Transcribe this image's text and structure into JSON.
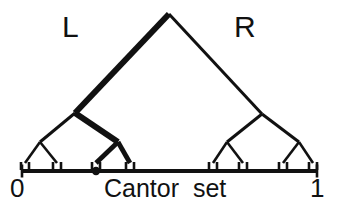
{
  "figure": {
    "kind": "cantor-set-binary-tree-diagram",
    "caption": "Cantor  set",
    "branch_labels": {
      "left": "L",
      "right": "R"
    },
    "axis": {
      "start_label": "0",
      "end_label": "1",
      "x_start": 22,
      "x_end": 317,
      "y": 171,
      "cap_height": 13,
      "line_width": 4
    },
    "marked_point": {
      "label": "",
      "x": 96,
      "y": 171,
      "radius": 4.2
    },
    "colors": {
      "ink": "#111111",
      "background": "#ffffff"
    },
    "stroke_widths": {
      "thin": 3.0,
      "bold": 6.0,
      "leaf": 2.6,
      "tick": 2.6
    },
    "tree": {
      "apex": {
        "x": 169,
        "y": 14
      },
      "nodes": [
        {
          "id": "root",
          "x": 169,
          "y": 14,
          "depth": 0
        },
        {
          "id": "L",
          "x": 75,
          "y": 113,
          "depth": 1
        },
        {
          "id": "R",
          "x": 262,
          "y": 114,
          "depth": 1
        },
        {
          "id": "LL",
          "x": 40,
          "y": 142,
          "depth": 2
        },
        {
          "id": "LR",
          "x": 118,
          "y": 142,
          "depth": 2
        },
        {
          "id": "RL",
          "x": 227,
          "y": 142,
          "depth": 2
        },
        {
          "id": "RR",
          "x": 299,
          "y": 142,
          "depth": 2
        }
      ],
      "edges": [
        {
          "from": "root",
          "to": "L",
          "bold": true
        },
        {
          "from": "root",
          "to": "R",
          "bold": false
        },
        {
          "from": "L",
          "to": "LL",
          "bold": false
        },
        {
          "from": "L",
          "to": "LR",
          "bold": true
        },
        {
          "from": "R",
          "to": "RL",
          "bold": false
        },
        {
          "from": "R",
          "to": "RR",
          "bold": false
        }
      ],
      "leaf_clusters": [
        {
          "id": "LL",
          "apex_x": 40,
          "apex_y": 142,
          "left_x": 25,
          "right_x": 57,
          "base_y": 163,
          "bold": false
        },
        {
          "id": "LR",
          "apex_x": 118,
          "apex_y": 142,
          "left_x": 96,
          "right_x": 130,
          "base_y": 163,
          "bold": true
        },
        {
          "id": "RL",
          "apex_x": 227,
          "apex_y": 142,
          "left_x": 213,
          "right_x": 243,
          "base_y": 163,
          "bold": false
        },
        {
          "id": "RR",
          "apex_x": 299,
          "apex_y": 142,
          "left_x": 283,
          "right_x": 313,
          "base_y": 163,
          "bold": false
        }
      ],
      "tick_length": 7
    }
  }
}
